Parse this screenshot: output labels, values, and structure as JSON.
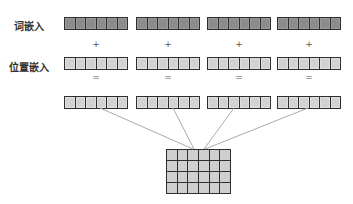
{
  "labels": {
    "word_embedding": "词嵌入",
    "position_embedding": "位置嵌入"
  },
  "operators": {
    "plus": "+",
    "equals": "="
  },
  "vectors": {
    "count": 4,
    "cells_per_vector": 6
  },
  "matrix": {
    "rows": 4,
    "cols": 6
  },
  "colors": {
    "word_cell": "#8c8c8c",
    "position_cell": "#d2d2d2",
    "output_cell": "#d2d2d2",
    "border": "#2e2e2e",
    "connector": "#aaaaaa"
  }
}
